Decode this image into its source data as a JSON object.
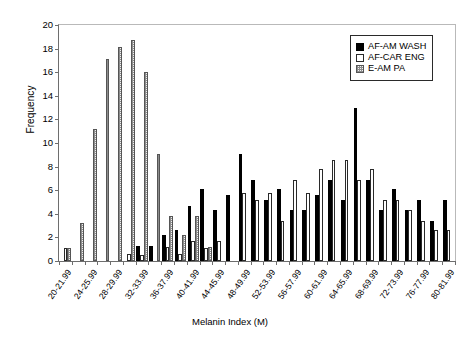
{
  "chart_data": {
    "type": "bar",
    "title": "",
    "xlabel": "Melanin Index (M)",
    "ylabel": "Frequency",
    "ylim": [
      0,
      20
    ],
    "ytick_step": 2,
    "yticks": [
      0,
      2,
      4,
      6,
      8,
      10,
      12,
      14,
      16,
      18,
      20
    ],
    "grid": false,
    "legend_position": "top-right",
    "categories": [
      "20-21.99",
      "22-23.99",
      "24-25.99",
      "26-27.99",
      "28-29.99",
      "30-31.99",
      "32-33.99",
      "34-35.99",
      "36-37.99",
      "38-39.99",
      "40-41.99",
      "42-43.99",
      "44-45.99",
      "46-47.99",
      "48-49.99",
      "50-51.99",
      "52-53.99",
      "54-55.99",
      "56-57.99",
      "58-59.99",
      "60-61.99",
      "62-63.99",
      "64-65.99",
      "66-67.99",
      "68-69.99",
      "70-71.99",
      "72-73.99",
      "74-75.99",
      "76-77.99",
      "78-79.99",
      "80-81.99"
    ],
    "tick_labels": [
      "20-21.99",
      "",
      "24-25.99",
      "",
      "28-29.99",
      "",
      "32-33.99",
      "",
      "36-37.99",
      "",
      "40-41.99",
      "",
      "44-45.99",
      "",
      "48-49.99",
      "",
      "52-53.99",
      "",
      "56-57.99",
      "",
      "60-61.99",
      "",
      "64-65.99",
      "",
      "68-69.99",
      "",
      "72-73.99",
      "",
      "76-77.99",
      "",
      "80-81.99"
    ],
    "series": [
      {
        "name": "AF-AM WASH",
        "color": "#000000",
        "fill": "solid-black",
        "values": [
          0,
          0,
          0,
          0,
          0,
          0,
          1.3,
          1.3,
          2.2,
          2.6,
          4.7,
          6.1,
          4.3,
          5.6,
          9.1,
          6.9,
          5.2,
          6.1,
          4.3,
          4.3,
          5.6,
          6.9,
          5.2,
          13,
          6.9,
          4.3,
          6.1,
          4.3,
          5.2,
          3.4,
          5.2
        ]
      },
      {
        "name": "AF-CAR ENG",
        "color": "#ffffff",
        "fill": "open-white",
        "values": [
          1.1,
          0,
          0,
          0,
          0,
          0.6,
          0.5,
          0,
          1.2,
          0.6,
          1.7,
          1.1,
          1.7,
          0,
          5.8,
          5.2,
          5.8,
          3.4,
          6.9,
          5.8,
          7.8,
          8.6,
          8.6,
          6.9,
          7.8,
          5.2,
          5.2,
          4.3,
          3.4,
          2.6,
          2.6
        ]
      },
      {
        "name": "E-AM PA",
        "color": "#e8e8e8",
        "fill": "stippled-gray",
        "values": [
          1.1,
          3.2,
          11.2,
          17.1,
          18.1,
          18.7,
          16,
          9.1,
          3.8,
          2.2,
          3.8,
          1.2,
          0,
          0,
          0,
          0,
          0,
          0,
          0,
          0,
          0,
          0,
          0,
          0,
          0,
          0,
          0,
          0,
          0,
          0,
          0
        ]
      }
    ],
    "series_display": [
      {
        "name": "AF-AM WASH",
        "bars": [
          {
            "bin": "32-33.99",
            "v": 1.3
          },
          {
            "bin": "34-35.99",
            "v": 1.3
          },
          {
            "bin": "36-37.99",
            "v": 2.2
          },
          {
            "bin": "38-39.99",
            "v": 2.6
          },
          {
            "bin": "40-41.99",
            "v": 4.7
          },
          {
            "bin": "42-43.99",
            "v": 6.1
          },
          {
            "bin": "44-45.99",
            "v": 4.3
          },
          {
            "bin": "46-47.99",
            "v": 5.6
          },
          {
            "bin": "48-49.99",
            "v": 9.1
          },
          {
            "bin": "50-51.99",
            "v": 6.9
          },
          {
            "bin": "52-53.99",
            "v": 13
          },
          {
            "bin": "54-55.99",
            "v": 6.1
          },
          {
            "bin": "56-57.99",
            "v": 5.2
          },
          {
            "bin": "58-59.99",
            "v": 5.6
          },
          {
            "bin": "60-61.99",
            "v": 4.3
          },
          {
            "bin": "62-63.99",
            "v": 4.3
          },
          {
            "bin": "64-65.99",
            "v": 3.4
          },
          {
            "bin": "66-67.99",
            "v": 3.4
          },
          {
            "bin": "68-69.99",
            "v": 2.6
          },
          {
            "bin": "70-71.99",
            "v": 2.6
          },
          {
            "bin": "72-73.99",
            "v": 1.7
          },
          {
            "bin": "74-75.99",
            "v": 0.6
          },
          {
            "bin": "76-77.99",
            "v": 0.6
          },
          {
            "bin": "78-79.99",
            "v": 1.1
          },
          {
            "bin": "80-81.99",
            "v": 0.3
          }
        ]
      }
    ],
    "bar_peak_note": "13",
    "n_bins": 31,
    "n_series": 3
  },
  "legend": {
    "items": [
      {
        "label": "AF-AM WASH",
        "swatch": "solid-black"
      },
      {
        "label": "AF-CAR ENG",
        "swatch": "open-white"
      },
      {
        "label": "E-AM PA",
        "swatch": "stippled-gray"
      }
    ]
  },
  "axes": {
    "y_title": "Frequency",
    "x_title": "Melanin Index (M)"
  },
  "colors": {
    "series_black": "#000000",
    "series_white": "#ffffff",
    "series_hatch": "#e8e8e8",
    "axis": "#6e6e6e",
    "frame_light": "#b9b9b9",
    "text": "#000000"
  }
}
